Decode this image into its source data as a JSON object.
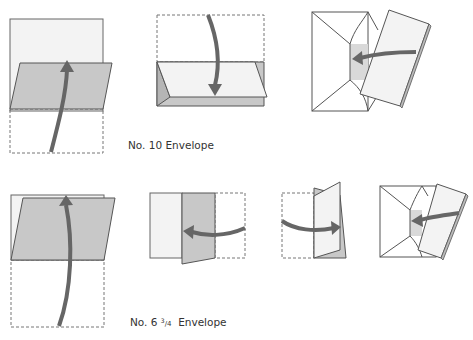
{
  "diagram": {
    "rows": [
      {
        "id": "no10",
        "label": "No. 10 Envelope",
        "steps": [
          {
            "step": 1,
            "description": "Fold bottom third of sheet up",
            "arrow": "up"
          },
          {
            "step": 2,
            "description": "Fold top third of sheet down",
            "arrow": "down"
          },
          {
            "step": 3,
            "description": "Insert folded letter into envelope",
            "arrow": "left"
          }
        ]
      },
      {
        "id": "no6-3-4",
        "label_prefix": "No. 6",
        "label_fraction_num": "3",
        "label_fraction_den": "4",
        "label_suffix": "Envelope",
        "steps": [
          {
            "step": 1,
            "description": "Fold bottom half of sheet up",
            "arrow": "up"
          },
          {
            "step": 2,
            "description": "Fold right third to the left",
            "arrow": "left"
          },
          {
            "step": 3,
            "description": "Fold left third to the right",
            "arrow": "right"
          },
          {
            "step": 4,
            "description": "Insert folded letter into envelope",
            "arrow": "left"
          }
        ]
      }
    ],
    "colors": {
      "paper": "#f3f3f3",
      "paper_fold": "#c8c8c8",
      "outline": "#555555",
      "dashed": "#777777",
      "arrow": "#666666",
      "envelope": "#ffffff",
      "envelope_inside": "#d9d9d9"
    }
  }
}
